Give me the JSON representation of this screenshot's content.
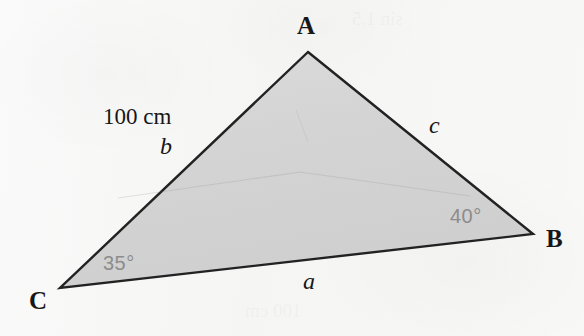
{
  "figure": {
    "type": "triangle-diagram",
    "fill_color": "#d5d5d5",
    "stroke_color": "#222222",
    "background_color": "#f7f7f6",
    "angle_label_color": "#8c8c8c"
  },
  "vertices": {
    "a": {
      "label": "A",
      "x": 308,
      "y": 52
    },
    "b": {
      "label": "B",
      "x": 533,
      "y": 234
    },
    "c": {
      "label": "C",
      "x": 60,
      "y": 288
    }
  },
  "sides": {
    "a": {
      "label": "a",
      "between": "C-B"
    },
    "b": {
      "label": "b",
      "between": "C-A",
      "length": "100 cm"
    },
    "c": {
      "label": "c",
      "between": "A-B"
    }
  },
  "angles": {
    "at_c": {
      "label": "35°",
      "value": 35
    },
    "at_b": {
      "label": "40°",
      "value": 40
    }
  },
  "ghost_text": {
    "top": "sin 1.5",
    "bottom": "100 cm"
  }
}
